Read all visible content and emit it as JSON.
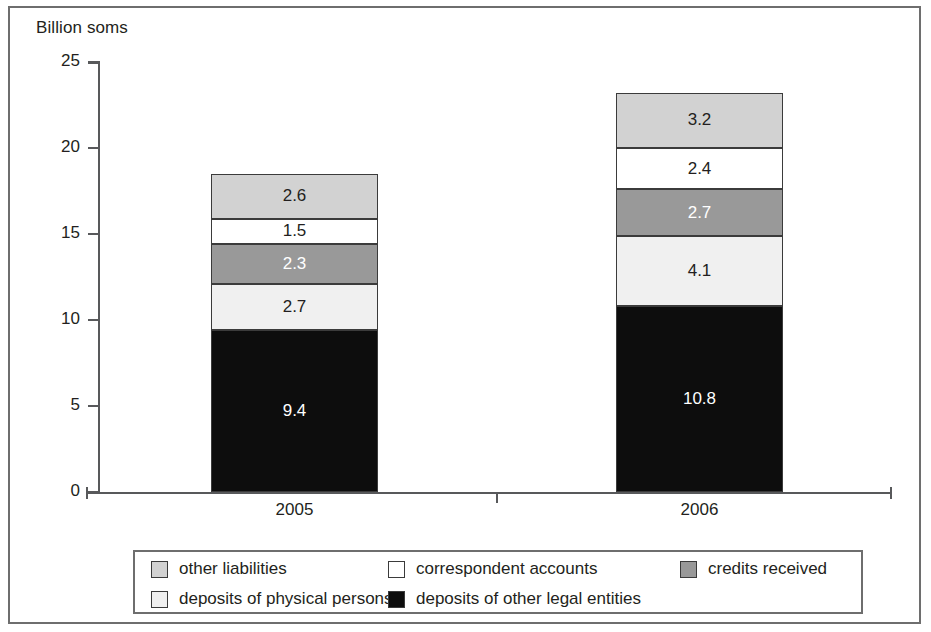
{
  "chart_data": {
    "type": "bar",
    "subtype": "stacked-vertical",
    "title": "",
    "ylabel": "Billion soms",
    "xlabel": "",
    "ylim": [
      0,
      25
    ],
    "yticks": [
      "0",
      "5",
      "10",
      "15",
      "20",
      "25"
    ],
    "grid": false,
    "legend_position": "bottom",
    "categories": [
      "2005",
      "2006"
    ],
    "stack_order_bottom_to_top": [
      "deposits of other legal entities",
      "deposits of physical persons",
      "credits received",
      "correspondent accounts",
      "other liabilities"
    ],
    "series": [
      {
        "name": "deposits of other legal entities",
        "color": "#0d0d0d",
        "label_color": "#ffffff",
        "values": [
          9.4,
          10.8
        ],
        "labels": [
          "9.4",
          "10.8"
        ]
      },
      {
        "name": "deposits of physical persons",
        "color": "#f0f0f0",
        "label_color": "#231f20",
        "values": [
          2.7,
          4.1
        ],
        "labels": [
          "2.7",
          "4.1"
        ]
      },
      {
        "name": "credits received",
        "color": "#999999",
        "label_color": "#ffffff",
        "values": [
          2.3,
          2.7
        ],
        "labels": [
          "2.3",
          "2.7"
        ]
      },
      {
        "name": "correspondent accounts",
        "color": "#ffffff",
        "label_color": "#231f20",
        "values": [
          1.5,
          2.4
        ],
        "labels": [
          "1.5",
          "2.4"
        ]
      },
      {
        "name": "other liabilities",
        "color": "#d2d2d2",
        "label_color": "#231f20",
        "values": [
          2.6,
          3.2
        ],
        "labels": [
          "2.6",
          "3.2"
        ]
      }
    ],
    "totals": [
      18.5,
      23.2
    ]
  },
  "axis": {
    "y_title": "Billion soms",
    "y_ticks": [
      {
        "value": "25"
      },
      {
        "value": "20"
      },
      {
        "value": "15"
      },
      {
        "value": "10"
      },
      {
        "value": "5"
      },
      {
        "value": "0"
      }
    ],
    "x_ticks": [
      {
        "label": "2005"
      },
      {
        "label": "2006"
      }
    ]
  },
  "bars": [
    {
      "category": "2005",
      "segments": [
        {
          "label": "2.6",
          "name": "other liabilities"
        },
        {
          "label": "1.5",
          "name": "correspondent accounts"
        },
        {
          "label": "2.3",
          "name": "credits received"
        },
        {
          "label": "2.7",
          "name": "deposits of physical persons"
        },
        {
          "label": "9.4",
          "name": "deposits of other legal entities"
        }
      ]
    },
    {
      "category": "2006",
      "segments": [
        {
          "label": "3.2",
          "name": "other liabilities"
        },
        {
          "label": "2.4",
          "name": "correspondent accounts"
        },
        {
          "label": "2.7",
          "name": "credits received"
        },
        {
          "label": "4.1",
          "name": "deposits of physical persons"
        },
        {
          "label": "10.8",
          "name": "deposits of other legal entities"
        }
      ]
    }
  ],
  "legend": {
    "rows": [
      [
        {
          "label": "other liabilities",
          "color": "#d2d2d2"
        },
        {
          "label": "correspondent accounts",
          "color": "#ffffff"
        },
        {
          "label": "credits received",
          "color": "#999999"
        }
      ],
      [
        {
          "label": "deposits of physical persons",
          "color": "#f0f0f0"
        },
        {
          "label": "deposits of other legal entities",
          "color": "#0d0d0d"
        }
      ]
    ]
  }
}
